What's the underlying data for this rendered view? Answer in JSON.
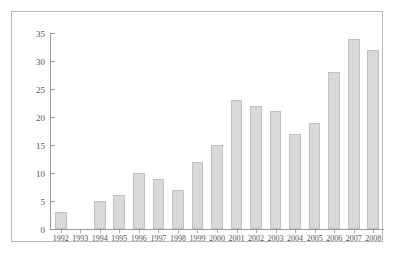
{
  "chart_data": {
    "type": "bar",
    "title": "",
    "subtitle": "",
    "xlabel": "",
    "ylabel": "",
    "categories": [
      "1992",
      "1993",
      "1994",
      "1995",
      "1996",
      "1997",
      "1998",
      "1999",
      "2000",
      "2001",
      "2002",
      "2003",
      "2004",
      "2005",
      "2006",
      "2007",
      "2008"
    ],
    "values": [
      3,
      0,
      5,
      6,
      10,
      9,
      7,
      12,
      15,
      23,
      22,
      21,
      17,
      19,
      28,
      34,
      32
    ],
    "ylim": [
      0,
      35
    ],
    "yticks": [
      0,
      5,
      10,
      15,
      20,
      25,
      30,
      35
    ],
    "ytick_labels": [
      "0",
      "5",
      "10",
      "15",
      "20",
      "25",
      "30",
      "35"
    ],
    "grid": false,
    "legend": false,
    "legend_position": "none",
    "bar_color": "#d9d9d9",
    "bar_edge_color": "#c2c2c2",
    "axis_color": "#9a9a9a",
    "tick_label_color": "#555555",
    "frame_color": "#b9b9b9",
    "background_color": "#ffffff"
  }
}
